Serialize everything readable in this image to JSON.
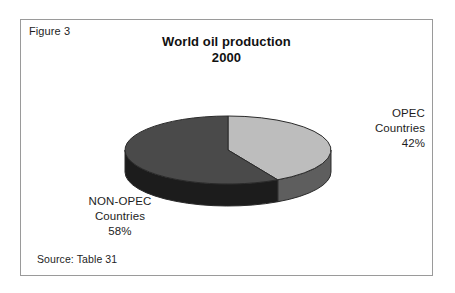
{
  "figure": {
    "label": "Figure 3",
    "source": "Source: Table 31"
  },
  "chart_data": {
    "type": "pie",
    "title": "World oil production",
    "subtitle": "2000",
    "xlabel": "",
    "ylabel": "",
    "unit": "%",
    "three_d": true,
    "legend": "none",
    "grid": false,
    "categories": [
      "OPEC Countries",
      "NON-OPEC Countries"
    ],
    "values": [
      42,
      58
    ],
    "slices": [
      {
        "name": "OPEC Countries",
        "label_line1": "OPEC",
        "label_line2": "Countries",
        "label_line3": "42%",
        "value": 42,
        "top_color": "#bdbdbd",
        "side_color": "#5e5e5e"
      },
      {
        "name": "NON-OPEC Countries",
        "label_line1": "NON-OPEC",
        "label_line2": "Countries",
        "label_line3": "58%",
        "value": 58,
        "top_color": "#4a4a4a",
        "side_color": "#1c1c1c"
      }
    ],
    "geometry": {
      "cx": 228,
      "cy": 150,
      "rx": 103,
      "ry": 34,
      "depth": 22,
      "start_angle_deg": -90
    },
    "colors": {
      "background": "#ffffff",
      "frame": "#9a9a9a",
      "text": "#1d1d1d",
      "outline": "#2a2a2a"
    }
  }
}
